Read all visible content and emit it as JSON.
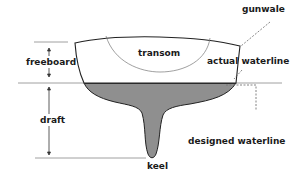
{
  "diagram": {
    "labels": {
      "gunwale": "gunwale",
      "transom": "transom",
      "freeboard": "freeboard",
      "actual_waterline": "actual waterline",
      "draft": "draft",
      "designed_waterline": "designed waterline",
      "keel": "keel"
    },
    "colors": {
      "hull_outline": "#222222",
      "submerged_fill": "#8f8f8f",
      "waterline_band": "#333333",
      "guide_lines": "#999999",
      "text": "#1a1a1a"
    }
  }
}
